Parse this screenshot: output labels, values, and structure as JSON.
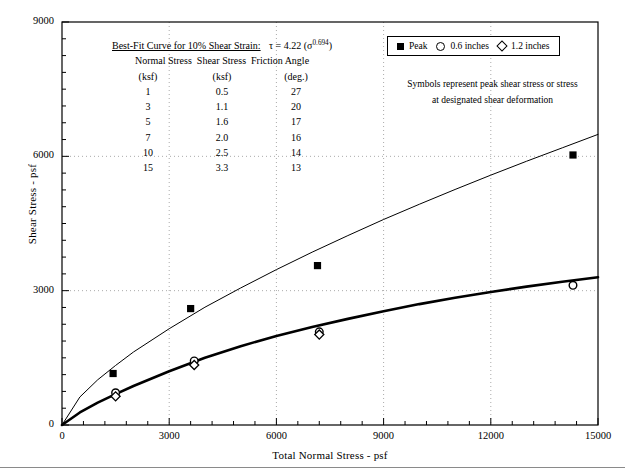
{
  "chart_data": {
    "type": "scatter",
    "title": "",
    "xlabel": "Total Normal Stress - psf",
    "ylabel": "Shear Stress - psf",
    "xlim": [
      0,
      15000
    ],
    "ylim": [
      0,
      9000
    ],
    "xticks": [
      0,
      3000,
      6000,
      9000,
      12000,
      15000
    ],
    "yticks": [
      0,
      3000,
      6000,
      9000
    ],
    "xtick_labels": [
      "0",
      "3000",
      "6000",
      "9000",
      "12000",
      "15000"
    ],
    "ytick_labels": [
      "0",
      "3000",
      "6000",
      "9000"
    ],
    "grid": true,
    "grid_style": "dotted",
    "minor_ticks": true,
    "legend_position": "top-right",
    "series": [
      {
        "name": "Peak",
        "marker": "filled-square",
        "points": [
          {
            "x": 1430,
            "y": 1150
          },
          {
            "x": 3600,
            "y": 2600
          },
          {
            "x": 7150,
            "y": 3560
          },
          {
            "x": 14300,
            "y": 6030
          }
        ]
      },
      {
        "name": "0.6 inches",
        "marker": "open-circle",
        "points": [
          {
            "x": 1500,
            "y": 720
          },
          {
            "x": 3700,
            "y": 1430
          },
          {
            "x": 7200,
            "y": 2080
          },
          {
            "x": 14300,
            "y": 3120
          }
        ]
      },
      {
        "name": "1.2 inches",
        "marker": "open-diamond",
        "points": [
          {
            "x": 1500,
            "y": 640
          },
          {
            "x": 3700,
            "y": 1340
          },
          {
            "x": 7200,
            "y": 2020
          }
        ]
      }
    ],
    "curves": [
      {
        "name": "peak-best-fit-curve",
        "style": "thin",
        "equation": "tau = 4.22 * sigma^0.694",
        "points": [
          {
            "x": 0,
            "y": 0
          },
          {
            "x": 500,
            "y": 625
          },
          {
            "x": 1000,
            "y": 1010
          },
          {
            "x": 1500,
            "y": 1330
          },
          {
            "x": 2000,
            "y": 1630
          },
          {
            "x": 3000,
            "y": 2150
          },
          {
            "x": 4000,
            "y": 2630
          },
          {
            "x": 5000,
            "y": 3060
          },
          {
            "x": 6000,
            "y": 3470
          },
          {
            "x": 7000,
            "y": 3860
          },
          {
            "x": 8000,
            "y": 4230
          },
          {
            "x": 9000,
            "y": 4590
          },
          {
            "x": 10000,
            "y": 4930
          },
          {
            "x": 11000,
            "y": 5260
          },
          {
            "x": 12000,
            "y": 5580
          },
          {
            "x": 13000,
            "y": 5890
          },
          {
            "x": 14000,
            "y": 6190
          },
          {
            "x": 15000,
            "y": 6490
          }
        ]
      },
      {
        "name": "designated-deformation-curve",
        "style": "thick",
        "points": [
          {
            "x": 0,
            "y": 0
          },
          {
            "x": 500,
            "y": 280
          },
          {
            "x": 1000,
            "y": 500
          },
          {
            "x": 1500,
            "y": 690
          },
          {
            "x": 2000,
            "y": 870
          },
          {
            "x": 3000,
            "y": 1200
          },
          {
            "x": 4000,
            "y": 1500
          },
          {
            "x": 5000,
            "y": 1760
          },
          {
            "x": 6000,
            "y": 1990
          },
          {
            "x": 7000,
            "y": 2190
          },
          {
            "x": 8000,
            "y": 2370
          },
          {
            "x": 9000,
            "y": 2540
          },
          {
            "x": 10000,
            "y": 2700
          },
          {
            "x": 11000,
            "y": 2840
          },
          {
            "x": 12000,
            "y": 2970
          },
          {
            "x": 13000,
            "y": 3090
          },
          {
            "x": 14000,
            "y": 3200
          },
          {
            "x": 15000,
            "y": 3300
          }
        ]
      }
    ]
  },
  "legend": {
    "entries": [
      {
        "label": "Peak",
        "symbol": "filled-square"
      },
      {
        "label": "0.6 inches",
        "symbol": "open-circle"
      },
      {
        "label": "1.2 inches",
        "symbol": "open-diamond"
      }
    ]
  },
  "note": {
    "line1": "Symbols represent peak shear stress or stress",
    "line2": "at designated shear deformation"
  },
  "annotation": {
    "title": "Best-Fit Curve for 10% Shear Strain:",
    "equation_prefix": "τ = 4.22 (σ",
    "equation_exponent": "0.694",
    "equation_suffix": ")",
    "headers": [
      "Normal Stress",
      "Shear Stress",
      "Friction Angle"
    ],
    "units": [
      "(ksf)",
      "(ksf)",
      "(deg.)"
    ],
    "rows": [
      [
        "1",
        "0.5",
        "27"
      ],
      [
        "3",
        "1.1",
        "20"
      ],
      [
        "5",
        "1.6",
        "17"
      ],
      [
        "7",
        "2.0",
        "16"
      ],
      [
        "10",
        "2.5",
        "14"
      ],
      [
        "15",
        "3.3",
        "13"
      ]
    ]
  },
  "colors": {
    "axis": "#000000",
    "grid": "#aaaaaa",
    "curve": "#000000",
    "marker": "#000000",
    "footer_rule": "#8a8a8a"
  }
}
